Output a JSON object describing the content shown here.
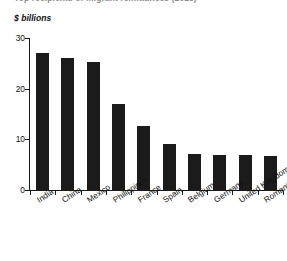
{
  "figure": {
    "clipped_title": "Top recipients of migrant remittances (2015)",
    "ylabel": "$ billions"
  },
  "chart_data": {
    "type": "bar",
    "title": "",
    "xlabel": "",
    "ylabel": "$ billions",
    "categories": [
      "India",
      "China",
      "Mexico",
      "Philippines",
      "France",
      "Spain",
      "Belgium",
      "Germany",
      "United Kingdom",
      "Romania"
    ],
    "values": [
      27,
      26,
      25.2,
      17,
      12.6,
      9,
      7.2,
      7,
      7,
      6.8
    ],
    "ylim": [
      0,
      30
    ],
    "yticks": [
      0,
      10,
      20,
      30
    ],
    "ytick_labels": [
      "0",
      "10",
      "20",
      "30"
    ],
    "grid": false,
    "legend": false,
    "bar_color": "#1b1b1b",
    "axis_color": "#1a1a1a"
  }
}
